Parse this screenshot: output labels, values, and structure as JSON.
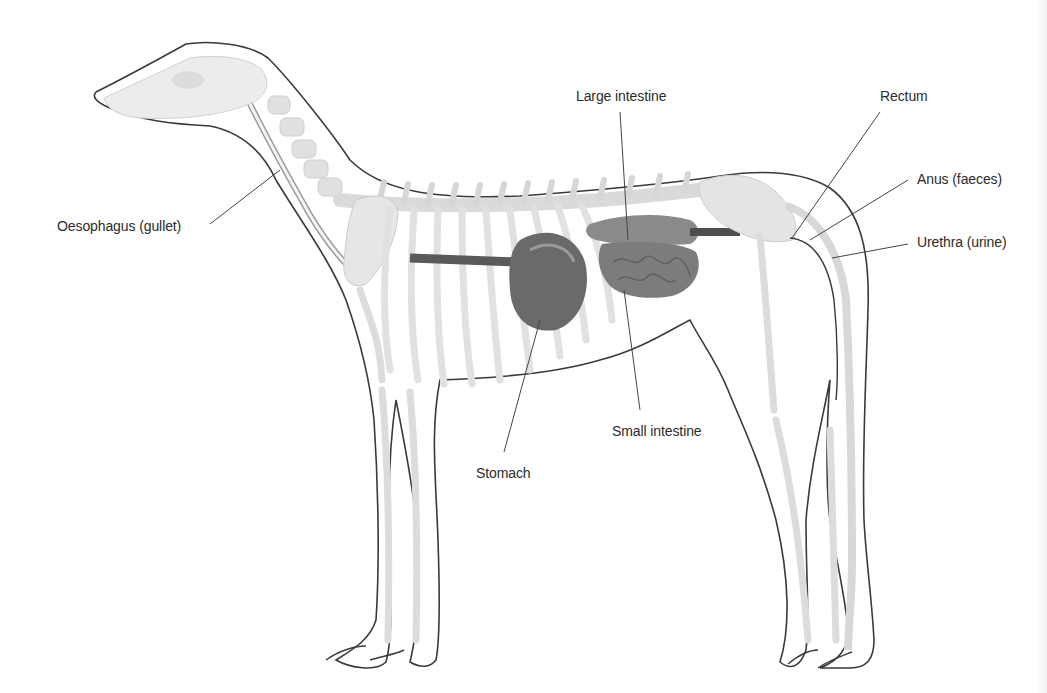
{
  "diagram": {
    "colors": {
      "outline": "#3a3a3a",
      "bone": "#e2e2e2",
      "bone_shade": "#cfcfcf",
      "organ_dark": "#4e4e4e",
      "organ_mid": "#7d7d7d",
      "leader": "#444444"
    },
    "labels": [
      {
        "id": "oesophagus",
        "text": "Oesophagus (gullet)",
        "x": 57,
        "y": 218
      },
      {
        "id": "large-intestine",
        "text": "Large intestine",
        "x": 576,
        "y": 88
      },
      {
        "id": "rectum",
        "text": "Rectum",
        "x": 880,
        "y": 88
      },
      {
        "id": "anus",
        "text": "Anus (faeces)",
        "x": 917,
        "y": 171
      },
      {
        "id": "urethra",
        "text": "Urethra (urine)",
        "x": 917,
        "y": 234
      },
      {
        "id": "small-intestine",
        "text": "Small intestine",
        "x": 612,
        "y": 423
      },
      {
        "id": "stomach",
        "text": "Stomach",
        "x": 476,
        "y": 465
      }
    ]
  }
}
